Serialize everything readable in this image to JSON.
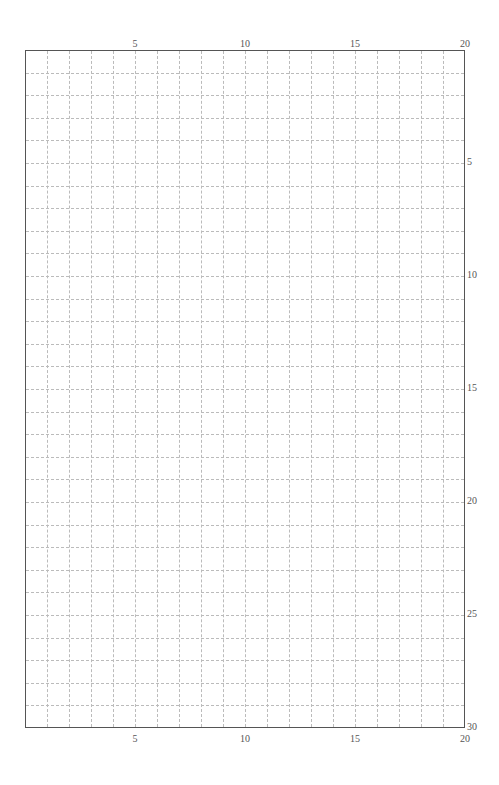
{
  "grid": {
    "columns": 20,
    "rows": 30,
    "line_color": "#bbbbbb",
    "frame_color": "#555555",
    "line_style": "dashed"
  },
  "axes": {
    "top_labels": [
      "5",
      "10",
      "15",
      "20"
    ],
    "bottom_labels": [
      "5",
      "10",
      "15",
      "20"
    ],
    "right_labels": [
      "5",
      "10",
      "15",
      "20",
      "25",
      "30"
    ]
  }
}
